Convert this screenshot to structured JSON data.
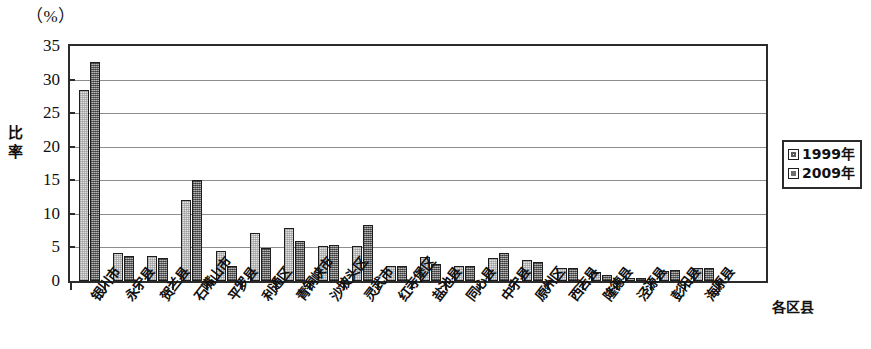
{
  "chart_data": {
    "type": "bar",
    "title": "",
    "unit_label": "（%）",
    "ylabel": "比率",
    "xlabel": "各区县",
    "ylim": [
      0,
      35
    ],
    "yticks": [
      0,
      5,
      10,
      15,
      20,
      25,
      30,
      35
    ],
    "grid": true,
    "legend_position": "right",
    "categories": [
      "银川市",
      "永宁县",
      "贺兰县",
      "石嘴山市",
      "平罗县",
      "利通区",
      "青铜峡市",
      "沙坡头区",
      "灵武市",
      "红寺堡区",
      "盐池县",
      "同心县",
      "中宁县",
      "原州区",
      "西吉县",
      "隆德县",
      "泾源县",
      "彭阳县",
      "海原县"
    ],
    "series": [
      {
        "name": "1999年",
        "color": "#e3e3e3",
        "values": [
          28.4,
          4.1,
          3.8,
          12.0,
          4.5,
          7.1,
          7.9,
          5.2,
          5.2,
          2.3,
          3.6,
          2.2,
          3.4,
          3.1,
          2.0,
          1.3,
          0.4,
          1.5,
          2.0
        ]
      },
      {
        "name": "2009年",
        "color": "#8e8e8e",
        "values": [
          32.6,
          3.7,
          3.5,
          15.1,
          2.2,
          4.9,
          6.0,
          5.3,
          8.3,
          2.3,
          2.5,
          2.2,
          4.2,
          2.9,
          1.9,
          0.9,
          0.5,
          1.6,
          2.0
        ]
      }
    ]
  }
}
